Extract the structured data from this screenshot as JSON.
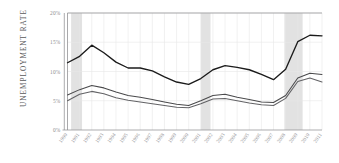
{
  "chart_data": {
    "type": "line",
    "title": "",
    "xlabel": "",
    "ylabel": "UNEMPLOYMENT RATE",
    "ylim": [
      0,
      20
    ],
    "yticks": [
      0,
      5,
      10,
      15,
      20
    ],
    "ytick_labels": [
      "0%",
      "5%",
      "10%",
      "15%",
      "20%"
    ],
    "grid": true,
    "legend": "none",
    "x": [
      1990,
      1991,
      1992,
      1993,
      1994,
      1995,
      1996,
      1997,
      1998,
      1999,
      2000,
      2001,
      2002,
      2003,
      2004,
      2005,
      2006,
      2007,
      2008,
      2009,
      2010,
      2011
    ],
    "xtick_labels": [
      "1990",
      "1991",
      "1992",
      "1993",
      "1994",
      "1995",
      "1996",
      "1997",
      "1998",
      "1999",
      "2000",
      "2001",
      "2002",
      "2003",
      "2004",
      "2005",
      "2006",
      "2007",
      "2008",
      "2009",
      "2010",
      "2011"
    ],
    "series": [
      {
        "name": "series-upper",
        "color": "#1b1b1b",
        "width": 1.35,
        "values": [
          11.5,
          12.6,
          14.5,
          13.2,
          11.6,
          10.6,
          10.6,
          10.1,
          9.1,
          8.2,
          7.8,
          8.8,
          10.3,
          11.0,
          10.7,
          10.3,
          9.5,
          8.6,
          10.4,
          15.1,
          16.2,
          16.1
        ]
      },
      {
        "name": "series-middle",
        "color": "#4a4a4c",
        "width": 1.05,
        "values": [
          6.0,
          6.9,
          7.6,
          7.2,
          6.5,
          5.9,
          5.6,
          5.2,
          4.8,
          4.4,
          4.2,
          5.0,
          5.9,
          6.1,
          5.6,
          5.2,
          4.8,
          4.7,
          5.9,
          8.9,
          9.7,
          9.5
        ]
      },
      {
        "name": "series-lower",
        "color": "#636366",
        "width": 1.05,
        "values": [
          5.0,
          6.1,
          6.6,
          6.2,
          5.5,
          5.1,
          4.8,
          4.5,
          4.2,
          3.9,
          3.8,
          4.5,
          5.3,
          5.4,
          5.0,
          4.6,
          4.3,
          4.2,
          5.4,
          8.3,
          8.9,
          8.2
        ]
      }
    ],
    "recession_bands": [
      {
        "name": "recession-1990",
        "start": 1990.3,
        "end": 1991.2
      },
      {
        "name": "recession-2001",
        "start": 2001.0,
        "end": 2001.8
      },
      {
        "name": "recession-2008",
        "start": 2007.9,
        "end": 2009.4
      }
    ],
    "band_color": "#e2e2e2",
    "grid_color": "#e8e8e8",
    "axis_color": "#8a8a8c"
  }
}
